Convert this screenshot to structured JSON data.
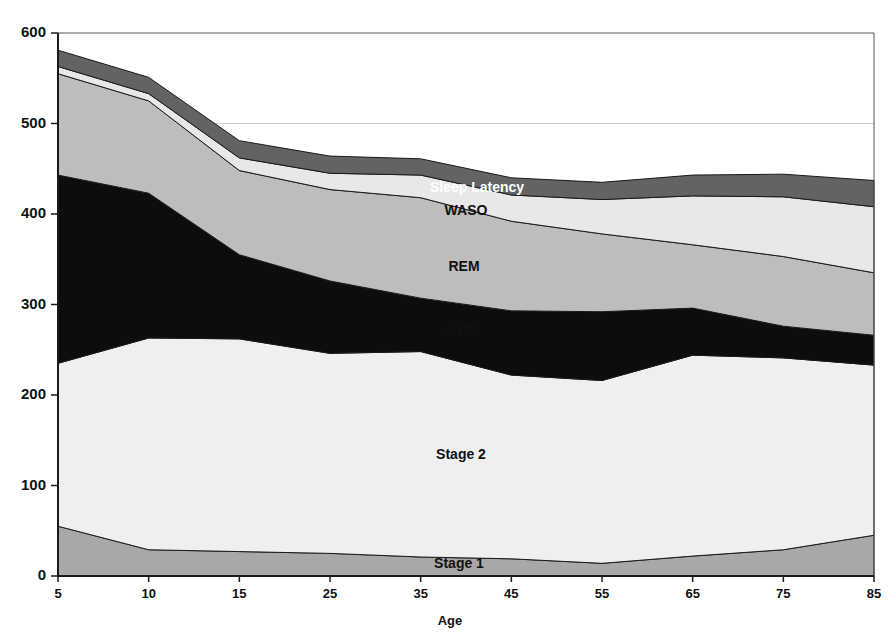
{
  "chart_data": {
    "type": "area",
    "stacked": true,
    "title": "",
    "subtitle": "",
    "xlabel": "Age",
    "ylabel": "",
    "x": [
      5,
      10,
      15,
      25,
      35,
      45,
      55,
      65,
      75,
      85
    ],
    "categories": [
      "5",
      "10",
      "15",
      "25",
      "35",
      "45",
      "55",
      "65",
      "75",
      "85"
    ],
    "xtick_labels": [
      "5",
      "10",
      "15",
      "25",
      "35",
      "45",
      "55",
      "65",
      "75",
      "85"
    ],
    "ytick_labels": [
      "0",
      "100",
      "200",
      "300",
      "400",
      "500",
      "600"
    ],
    "yticks": [
      0,
      100,
      200,
      300,
      400,
      500,
      600
    ],
    "ylim": [
      0,
      600
    ],
    "xlim": [
      5,
      85
    ],
    "grid": "horizontal-faint-at-500",
    "legend": "inline-labels",
    "stack_order_bottom_to_top": [
      "Stage 1",
      "Stage 2",
      "SWS",
      "REM",
      "WASO",
      "Sleep Latency"
    ],
    "series": [
      {
        "name": "Stage 1",
        "color": "#a8a8a8",
        "label": "Stage 1",
        "values": [
          55,
          29,
          27,
          25,
          21,
          19,
          14,
          22,
          29,
          45
        ]
      },
      {
        "name": "Stage 2",
        "color": "#efefef",
        "label": "Stage 2",
        "values": [
          180,
          234,
          235,
          221,
          227,
          203,
          202,
          222,
          212,
          188
        ]
      },
      {
        "name": "SWS",
        "color": "#0d0d0d",
        "label": "SWS",
        "values": [
          208,
          160,
          93,
          80,
          59,
          71,
          76,
          52,
          35,
          33
        ]
      },
      {
        "name": "REM",
        "color": "#bdbdbd",
        "label": "REM",
        "values": [
          112,
          102,
          93,
          101,
          111,
          99,
          86,
          70,
          77,
          69
        ]
      },
      {
        "name": "WASO",
        "color": "#e8e8e8",
        "label": "WASO",
        "values": [
          8,
          8,
          14,
          18,
          25,
          29,
          38,
          54,
          66,
          73
        ]
      },
      {
        "name": "Sleep Latency",
        "color": "#636363",
        "label": "Sleep Latency",
        "values": [
          18,
          18,
          19,
          19,
          18,
          19,
          19,
          23,
          25,
          29
        ]
      }
    ],
    "series_label_positions": [
      {
        "name": "Sleep Latency",
        "x_px": 477,
        "y_px": 188,
        "inverse": true
      },
      {
        "name": "WASO",
        "x_px": 466,
        "y_px": 211,
        "inverse": false
      },
      {
        "name": "REM",
        "x_px": 464,
        "y_px": 267,
        "inverse": false
      },
      {
        "name": "SWS",
        "x_px": 463,
        "y_px": 329,
        "inverse": false
      },
      {
        "name": "Stage 2",
        "x_px": 461,
        "y_px": 455,
        "inverse": false
      },
      {
        "name": "Stage 1",
        "x_px": 459,
        "y_px": 564,
        "inverse": false
      }
    ]
  },
  "axes": {
    "x_axis_title": "Age",
    "y_axis_title": ""
  },
  "colors": {
    "stage1": "#a8a8a8",
    "stage2": "#efefef",
    "sws": "#0d0d0d",
    "rem": "#bdbdbd",
    "waso": "#e8e8e8",
    "sleep_latency": "#636363",
    "axis": "#1a1a1a",
    "grid": "#cccccc",
    "background": "#ffffff"
  }
}
